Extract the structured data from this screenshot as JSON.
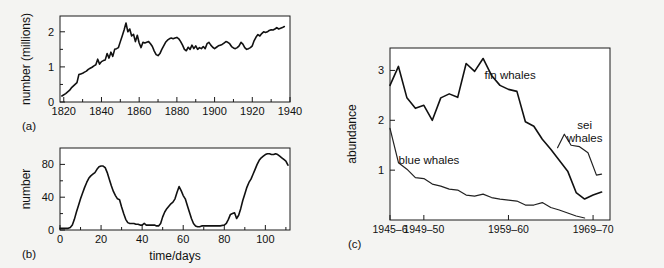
{
  "figure": {
    "background_color": "#f4f4f2",
    "line_color": "#111111"
  },
  "panels": [
    {
      "id": "a",
      "label": "(a)",
      "ylabel": "number (millions)",
      "xlabel": ""
    },
    {
      "id": "b",
      "label": "(b)",
      "ylabel": "number",
      "xlabel": "time/days"
    },
    {
      "id": "c",
      "label": "(c)",
      "ylabel": "abundance",
      "xlabel": ""
    }
  ],
  "chart_data": [
    {
      "type": "line",
      "panel": "a",
      "title": "",
      "xlabel": "",
      "ylabel": "number (millions)",
      "xlim": [
        1818,
        1940
      ],
      "ylim": [
        0,
        2.45
      ],
      "xticks": [
        1820,
        1840,
        1860,
        1880,
        1900,
        1920,
        1940
      ],
      "xticklabels": [
        "1820",
        "1840",
        "1860",
        "1880",
        "1900",
        "1920",
        "1940"
      ],
      "xminorticks": [
        1830,
        1850,
        1870,
        1890,
        1910,
        1930
      ],
      "yticks": [
        0,
        1,
        2
      ],
      "yticklabels": [
        "0",
        "1",
        "2"
      ],
      "yminorticks": [
        0.5,
        1.5
      ],
      "grid": false,
      "legend": "none",
      "series": [
        {
          "name": "population",
          "x": [
            1819,
            1821,
            1823,
            1824,
            1825,
            1826,
            1827,
            1828,
            1829,
            1830,
            1831,
            1832,
            1833,
            1834,
            1835,
            1836,
            1837,
            1838,
            1839,
            1840,
            1841,
            1842,
            1843,
            1844,
            1845,
            1846,
            1847,
            1848,
            1849,
            1850,
            1851,
            1852,
            1853,
            1854,
            1855,
            1856,
            1857,
            1858,
            1859,
            1860,
            1861,
            1862,
            1863,
            1864,
            1865,
            1866,
            1867,
            1868,
            1869,
            1870,
            1871,
            1872,
            1873,
            1874,
            1875,
            1876,
            1877,
            1878,
            1879,
            1880,
            1881,
            1882,
            1883,
            1884,
            1885,
            1886,
            1887,
            1888,
            1889,
            1890,
            1891,
            1892,
            1893,
            1894,
            1895,
            1896,
            1897,
            1898,
            1899,
            1900,
            1901,
            1902,
            1903,
            1904,
            1905,
            1906,
            1907,
            1908,
            1909,
            1910,
            1911,
            1912,
            1913,
            1914,
            1915,
            1916,
            1917,
            1918,
            1919,
            1920,
            1921,
            1922,
            1923,
            1924,
            1925,
            1926,
            1927,
            1928,
            1929,
            1930,
            1931,
            1932,
            1933,
            1934,
            1935,
            1936,
            1937,
            1938
          ],
          "y": [
            0.17,
            0.24,
            0.33,
            0.4,
            0.45,
            0.5,
            0.55,
            0.78,
            0.8,
            0.82,
            0.85,
            0.88,
            0.93,
            0.96,
            0.99,
            1.03,
            1.06,
            1.22,
            1.08,
            1.15,
            1.18,
            1.2,
            1.38,
            1.25,
            1.42,
            1.3,
            1.5,
            1.52,
            1.55,
            1.72,
            1.88,
            2.05,
            2.25,
            2.0,
            2.08,
            1.88,
            1.93,
            1.72,
            1.9,
            1.68,
            1.55,
            1.7,
            1.68,
            1.7,
            1.72,
            1.66,
            1.58,
            1.45,
            1.35,
            1.32,
            1.38,
            1.5,
            1.6,
            1.7,
            1.76,
            1.8,
            1.82,
            1.8,
            1.82,
            1.84,
            1.8,
            1.72,
            1.62,
            1.5,
            1.46,
            1.56,
            1.5,
            1.62,
            1.52,
            1.6,
            1.5,
            1.55,
            1.52,
            1.58,
            1.52,
            1.66,
            1.7,
            1.62,
            1.56,
            1.52,
            1.56,
            1.6,
            1.62,
            1.64,
            1.68,
            1.72,
            1.7,
            1.66,
            1.58,
            1.54,
            1.52,
            1.55,
            1.6,
            1.7,
            1.65,
            1.55,
            1.5,
            1.52,
            1.55,
            1.6,
            1.75,
            1.85,
            1.92,
            1.88,
            1.95,
            2.0,
            1.98,
            2.0,
            2.04,
            2.06,
            2.05,
            2.08,
            2.12,
            2.08,
            2.1,
            2.12,
            2.15
          ]
        }
      ]
    },
    {
      "type": "line",
      "panel": "b",
      "title": "",
      "xlabel": "time/days",
      "ylabel": "number",
      "xlim": [
        0,
        112
      ],
      "ylim": [
        0,
        100
      ],
      "xticks": [
        0,
        20,
        40,
        60,
        80,
        100
      ],
      "xticklabels": [
        "0",
        "20",
        "40",
        "60",
        "80",
        "100"
      ],
      "xminorticks": [
        10,
        30,
        50,
        70,
        90,
        110
      ],
      "yticks": [
        0,
        40,
        80
      ],
      "yticklabels": [
        "0",
        "40",
        "80"
      ],
      "yminorticks": [
        20,
        60
      ],
      "grid": false,
      "legend": "none",
      "series": [
        {
          "name": "infected",
          "x": [
            0,
            2,
            4,
            5,
            6,
            7,
            8,
            9,
            10,
            11,
            12,
            13,
            14,
            15,
            16,
            17,
            18,
            19,
            20,
            21,
            22,
            23,
            24,
            25,
            26,
            27,
            28,
            29,
            30,
            31,
            32,
            33,
            34,
            35,
            36,
            37,
            38,
            39,
            40,
            41,
            42,
            43,
            44,
            45,
            46,
            47,
            48,
            49,
            50,
            51,
            52,
            53,
            54,
            55,
            56,
            57,
            58,
            59,
            60,
            61,
            62,
            63,
            64,
            65,
            66,
            67,
            68,
            69,
            70,
            72,
            74,
            76,
            78,
            80,
            81,
            82,
            83,
            84,
            85,
            86,
            87,
            88,
            89,
            90,
            91,
            92,
            93,
            94,
            95,
            96,
            97,
            98,
            99,
            100,
            101,
            102,
            103,
            104,
            105,
            106,
            107,
            108,
            109,
            110,
            111
          ],
          "y": [
            2,
            2,
            2,
            3,
            6,
            13,
            22,
            30,
            38,
            45,
            52,
            58,
            63,
            66,
            68,
            70,
            74,
            77,
            78,
            78,
            76,
            70,
            62,
            54,
            47,
            42,
            38,
            37,
            28,
            20,
            13,
            9,
            8,
            8,
            8,
            7,
            7,
            6,
            6,
            8,
            6,
            6,
            6,
            6,
            6,
            5,
            5,
            8,
            16,
            22,
            26,
            29,
            32,
            34,
            38,
            46,
            53,
            48,
            42,
            38,
            30,
            22,
            14,
            8,
            5,
            4,
            4,
            5,
            5,
            5,
            5,
            5,
            5,
            6,
            8,
            13,
            19,
            20,
            21,
            14,
            18,
            26,
            36,
            44,
            52,
            58,
            62,
            68,
            74,
            80,
            85,
            88,
            90,
            92,
            93,
            93,
            92,
            92,
            93,
            92,
            90,
            88,
            86,
            84,
            79
          ]
        }
      ]
    },
    {
      "type": "line",
      "panel": "c",
      "title": "",
      "xlabel": "",
      "ylabel": "abundance",
      "xlim": [
        1945,
        1971
      ],
      "ylim": [
        0,
        3.45
      ],
      "xticks": [
        1945,
        1949,
        1959,
        1969
      ],
      "xticklabels": [
        "1945–6",
        "1949–50",
        "1959–60",
        "1969–70"
      ],
      "yticks": [
        1,
        2,
        3
      ],
      "yticklabels": [
        "1",
        "2",
        "3"
      ],
      "grid": false,
      "legend": "inline-annotations",
      "annotations": [
        {
          "text": "fin whales",
          "x": 1959.2,
          "y": 2.82
        },
        {
          "text": "blue whales",
          "x": 1949.6,
          "y": 1.12
        },
        {
          "text": "sei whales",
          "x": 1968.0,
          "y": 1.82
        }
      ],
      "series": [
        {
          "name": "fin whales",
          "x": [
            1945,
            1946,
            1947,
            1948,
            1949,
            1950,
            1951,
            1952,
            1953,
            1954,
            1955,
            1956,
            1957,
            1958,
            1959,
            1960,
            1961,
            1962,
            1963,
            1964,
            1965,
            1966,
            1967,
            1968,
            1969,
            1970
          ],
          "y": [
            2.7,
            3.08,
            2.45,
            2.24,
            2.3,
            2.0,
            2.45,
            2.53,
            2.46,
            3.14,
            2.98,
            3.24,
            2.9,
            2.7,
            2.62,
            2.58,
            1.97,
            1.88,
            1.62,
            1.42,
            1.2,
            0.98,
            0.55,
            0.42,
            0.5,
            0.56
          ]
        },
        {
          "name": "blue whales",
          "x": [
            1945,
            1946,
            1947,
            1948,
            1949,
            1950,
            1951,
            1952,
            1953,
            1954,
            1955,
            1956,
            1957,
            1958,
            1959,
            1960,
            1961,
            1962,
            1963,
            1964,
            1965,
            1966,
            1967,
            1968
          ],
          "y": [
            1.84,
            1.15,
            1.02,
            0.85,
            0.83,
            0.72,
            0.68,
            0.62,
            0.6,
            0.5,
            0.48,
            0.52,
            0.45,
            0.42,
            0.4,
            0.38,
            0.3,
            0.3,
            0.35,
            0.25,
            0.2,
            0.14,
            0.08,
            0.04
          ]
        },
        {
          "name": "sei whales",
          "x": [
            1964.8,
            1965.6,
            1966.4,
            1967.4,
            1968.4,
            1969.4,
            1970.0
          ],
          "y": [
            1.45,
            1.72,
            1.5,
            1.47,
            1.35,
            0.9,
            0.92
          ]
        }
      ]
    }
  ]
}
